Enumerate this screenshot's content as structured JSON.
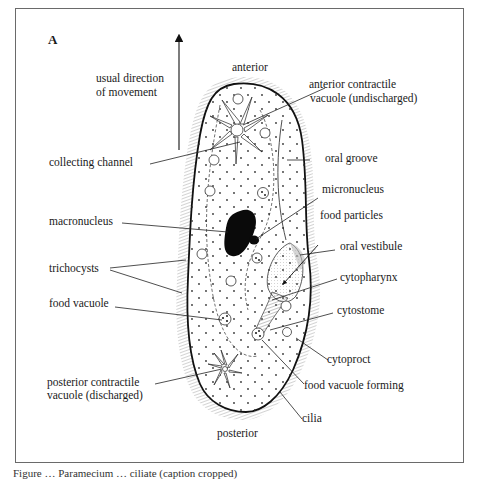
{
  "figure": {
    "panel_label": "A",
    "direction_label_line1": "usual direction",
    "direction_label_line2": "of movement",
    "orientation": {
      "top": "anterior",
      "bottom": "posterior"
    },
    "labels_left": [
      {
        "id": "collecting-channel",
        "text": "collecting channel"
      },
      {
        "id": "macronucleus",
        "text": "macronucleus"
      },
      {
        "id": "trichocysts",
        "text": "trichocysts"
      },
      {
        "id": "food-vacuole",
        "text": "food vacuole"
      },
      {
        "id": "posterior-contractile-vacuole",
        "line1": "posterior contractile",
        "line2": "vacuole (discharged)"
      }
    ],
    "labels_right": [
      {
        "id": "anterior-contractile-vacuole",
        "line1": "anterior contractile",
        "line2": "vacuole (undischarged)"
      },
      {
        "id": "oral-groove",
        "text": "oral groove"
      },
      {
        "id": "micronucleus",
        "text": "micronucleus"
      },
      {
        "id": "food-particles",
        "text": "food particles"
      },
      {
        "id": "oral-vestibule",
        "text": "oral vestibule"
      },
      {
        "id": "cytopharynx",
        "text": "cytopharynx"
      },
      {
        "id": "cytostome",
        "text": "cytostome"
      },
      {
        "id": "cytoproct",
        "text": "cytoproct"
      },
      {
        "id": "food-vacuole-forming",
        "text": "food vacuole forming"
      },
      {
        "id": "cilia",
        "text": "cilia"
      }
    ]
  },
  "caption": {
    "text": "Figure … Paramecium … ciliate (caption cropped)"
  }
}
